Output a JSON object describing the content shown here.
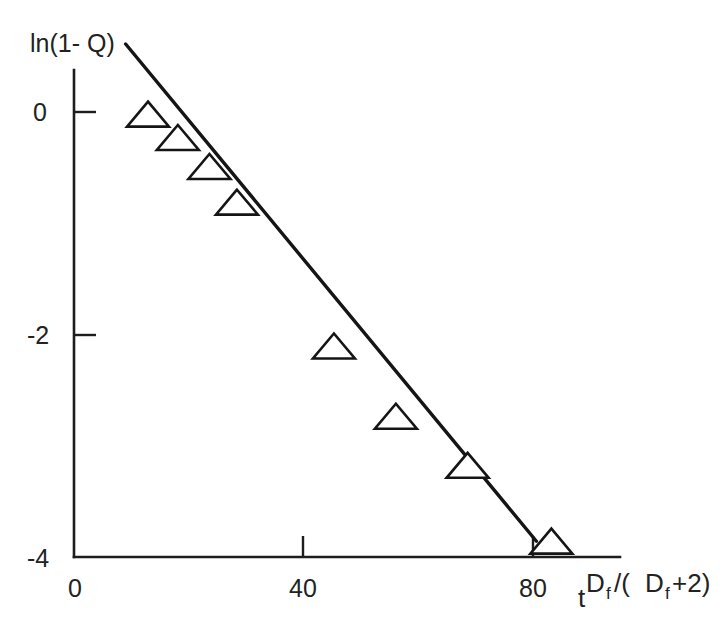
{
  "chart_data": {
    "type": "scatter",
    "title": "",
    "subtitle": "",
    "xlabel": "t^(Df/(Df+2))",
    "xlabel_parts": {
      "base": "t",
      "exponent": "Df /(Df +2)",
      "exp_d1": "D",
      "exp_f1": "f",
      "exp_mid": " /(",
      "exp_d2": "D",
      "exp_f2": "f",
      "exp_tail": " +2)"
    },
    "ylabel": "ln(1- Q)",
    "xlim": [
      0,
      92
    ],
    "ylim": [
      -4,
      0.75
    ],
    "xticks": [
      0,
      40,
      80
    ],
    "xtick_labels": [
      "0",
      "40",
      "80"
    ],
    "yticks": [
      0,
      -2,
      -4
    ],
    "ytick_labels": [
      "0",
      "-2",
      "-4"
    ],
    "grid": false,
    "legend": null,
    "marker": "open-triangle-up",
    "series": [
      {
        "name": "measured",
        "points": [
          {
            "x": 12.9,
            "y": -0.05
          },
          {
            "x": 18.1,
            "y": -0.26
          },
          {
            "x": 23.6,
            "y": -0.52
          },
          {
            "x": 28.4,
            "y": -0.84
          },
          {
            "x": 45.3,
            "y": -2.13
          },
          {
            "x": 56.1,
            "y": -2.76
          },
          {
            "x": 68.6,
            "y": -3.2
          },
          {
            "x": 83.2,
            "y": -3.88
          }
        ]
      }
    ],
    "fit_line": {
      "name": "linear-fit",
      "x_start": 9.0,
      "y_start": 0.61,
      "x_end": 80.6,
      "y_end": -3.85
    },
    "annotations": []
  }
}
